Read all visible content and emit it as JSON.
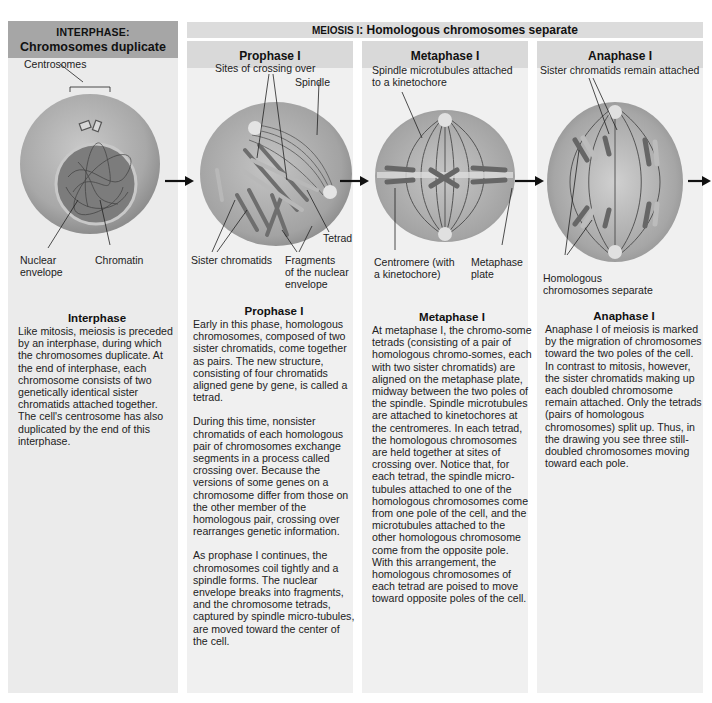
{
  "interphase": {
    "header_small": "INTERPHASE:",
    "header_main": "Chromosomes duplicate",
    "labels": {
      "centrosomes": "Centrosomes",
      "nuclear_envelope_1": "Nuclear",
      "nuclear_envelope_2": "envelope",
      "chromatin": "Chromatin"
    },
    "description": {
      "title": "Interphase",
      "paragraphs": [
        "Like mitosis, meiosis is preceded by an interphase, during which the chromosomes duplicate. At the end of interphase, each chromosome consists of two genetically identical sister chromatids attached together. The cell's centrosome has also duplicated by the end of this interphase."
      ]
    }
  },
  "meiosis_banner": {
    "prefix": "MEIOSIS I",
    "text": ": Homologous chromosomes separate"
  },
  "phases": [
    {
      "name": "Prophase I",
      "labels": {
        "sites": "Sites of crossing over",
        "spindle": "Spindle",
        "tetrad": "Tetrad",
        "sister_chromatids": "Sister chromatids",
        "fragments_1": "Fragments",
        "fragments_2": "of the nuclear",
        "fragments_3": "envelope"
      },
      "description": {
        "title": "Prophase I",
        "paragraphs": [
          "Early in this phase, homologous chromosomes, composed of two sister chromatids, come together as pairs. The new structure, consisting of four chromatids aligned gene by gene, is called a tetrad.",
          "During this time, nonsister chromatids of each homologous pair of chromosomes exchange segments in a process called crossing over. Because the versions of some genes on a chromosome differ from those on the other member of the homologous pair, crossing over rearranges genetic information.",
          "As prophase I continues, the chromosomes coil tightly and a spindle forms. The nuclear envelope breaks into fragments, and the chromosome tetrads, captured by spindle micro-tubules, are moved toward the center of the cell."
        ]
      }
    },
    {
      "name": "Metaphase I",
      "labels": {
        "spindle_1": "Spindle microtubules attached",
        "spindle_2": "to a kinetochore",
        "centromere_1": "Centromere (with",
        "centromere_2": "a kinetochore)",
        "plate_1": "Metaphase",
        "plate_2": "plate"
      },
      "description": {
        "title": "Metaphase I",
        "paragraphs": [
          "At metaphase I, the chromo-some tetrads (consisting of a pair of homologous chromo-somes, each with two sister chromatids) are aligned on the metaphase plate, midway between the two poles of the spindle. Spindle microtubules are attached to kinetochores at the centromeres. In each tetrad, the homologous chromosomes are held together at sites of crossing over. Notice that, for each tetrad, the spindle micro-tubules attached to one of the homologous chromosomes come from one pole of the cell, and the microtubules attached to the other homologous chromosome come from the opposite pole. With this arrangement, the homologous chromosomes of each tetrad are poised to move toward opposite poles of the cell."
        ]
      }
    },
    {
      "name": "Anaphase I",
      "labels": {
        "sister_attached": "Sister chromatids remain attached",
        "homologous_1": "Homologous",
        "homologous_2": "chromosomes separate"
      },
      "description": {
        "title": "Anaphase I",
        "paragraphs": [
          "Anaphase I of meiosis is marked by the migration of chromosomes toward the two poles of the cell. In contrast to mitosis, however, the sister chromatids making up each doubled chromosome remain attached. Only the tetrads (pairs of homologous chromosomes) split up. Thus, in the drawing you see three still-doubled chromosomes moving toward each pole."
        ]
      }
    }
  ],
  "colors": {
    "header_dark": "#a6a6a6",
    "header_light": "#d9d9d9",
    "panel": "#f0f0f0",
    "cell": "#9a9a9a",
    "arrow": "#111111"
  }
}
